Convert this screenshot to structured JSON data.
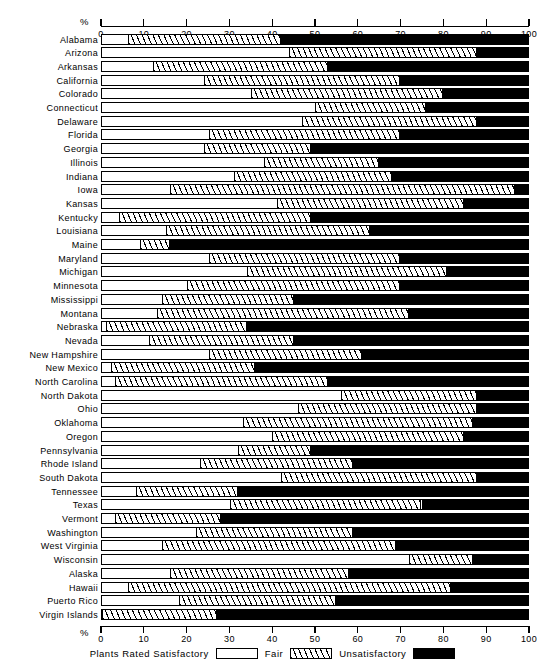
{
  "axis": {
    "unit_label": "%",
    "ticks": [
      0,
      10,
      20,
      30,
      40,
      50,
      60,
      70,
      80,
      90,
      100
    ]
  },
  "legend": {
    "prefix": "Plants  Rated  Satisfactory",
    "fair_label": "Fair",
    "unsat_label": "Unsatisfactory"
  },
  "chart_data": {
    "type": "bar",
    "orientation": "horizontal",
    "stacked": true,
    "title": "",
    "xlabel": "%",
    "ylabel": "",
    "xlim": [
      0,
      100
    ],
    "grid": false,
    "legend_position": "bottom",
    "series": [
      {
        "name": "Plants Rated Satisfactory",
        "fill": "white"
      },
      {
        "name": "Fair",
        "fill": "hatched"
      },
      {
        "name": "Unsatisfactory",
        "fill": "black"
      }
    ],
    "categories": [
      "Alabama",
      "Arizona",
      "Arkansas",
      "California",
      "Colorado",
      "Connecticut",
      "Delaware",
      "Florida",
      "Georgia",
      "Illinois",
      "Indiana",
      "Iowa",
      "Kansas",
      "Kentucky",
      "Louisiana",
      "Maine",
      "Maryland",
      "Michigan",
      "Minnesota",
      "Mississippi",
      "Montana",
      "Nebraska",
      "Nevada",
      "New Hampshire",
      "New Mexico",
      "North Carolina",
      "North Dakota",
      "Ohio",
      "Oklahoma",
      "Oregon",
      "Pennsylvania",
      "Rhode Island",
      "South Dakota",
      "Tennessee",
      "Texas",
      "Vermont",
      "Washington",
      "West Virginia",
      "Wisconsin",
      "Alaska",
      "Hawaii",
      "Puerto Rico",
      "Virgin Islands"
    ],
    "rows": [
      {
        "label": "Alabama",
        "satisfactory": 6,
        "fair": 36,
        "unsatisfactory": 58
      },
      {
        "label": "Arizona",
        "satisfactory": 44,
        "fair": 44,
        "unsatisfactory": 12
      },
      {
        "label": "Arkansas",
        "satisfactory": 12,
        "fair": 41,
        "unsatisfactory": 47
      },
      {
        "label": "California",
        "satisfactory": 24,
        "fair": 46,
        "unsatisfactory": 30
      },
      {
        "label": "Colorado",
        "satisfactory": 35,
        "fair": 45,
        "unsatisfactory": 20
      },
      {
        "label": "Connecticut",
        "satisfactory": 50,
        "fair": 26,
        "unsatisfactory": 24
      },
      {
        "label": "Delaware",
        "satisfactory": 47,
        "fair": 41,
        "unsatisfactory": 12
      },
      {
        "label": "Florida",
        "satisfactory": 25,
        "fair": 45,
        "unsatisfactory": 30
      },
      {
        "label": "Georgia",
        "satisfactory": 24,
        "fair": 25,
        "unsatisfactory": 51
      },
      {
        "label": "Illinois",
        "satisfactory": 38,
        "fair": 27,
        "unsatisfactory": 35
      },
      {
        "label": "Indiana",
        "satisfactory": 31,
        "fair": 37,
        "unsatisfactory": 32
      },
      {
        "label": "Iowa",
        "satisfactory": 16,
        "fair": 81,
        "unsatisfactory": 3
      },
      {
        "label": "Kansas",
        "satisfactory": 41,
        "fair": 44,
        "unsatisfactory": 15
      },
      {
        "label": "Kentucky",
        "satisfactory": 4,
        "fair": 45,
        "unsatisfactory": 51
      },
      {
        "label": "Louisiana",
        "satisfactory": 15,
        "fair": 48,
        "unsatisfactory": 37
      },
      {
        "label": "Maine",
        "satisfactory": 9,
        "fair": 7,
        "unsatisfactory": 84
      },
      {
        "label": "Maryland",
        "satisfactory": 25,
        "fair": 45,
        "unsatisfactory": 30
      },
      {
        "label": "Michigan",
        "satisfactory": 34,
        "fair": 47,
        "unsatisfactory": 19
      },
      {
        "label": "Minnesota",
        "satisfactory": 20,
        "fair": 50,
        "unsatisfactory": 30
      },
      {
        "label": "Mississippi",
        "satisfactory": 14,
        "fair": 31,
        "unsatisfactory": 55
      },
      {
        "label": "Montana",
        "satisfactory": 13,
        "fair": 59,
        "unsatisfactory": 28
      },
      {
        "label": "Nebraska",
        "satisfactory": 1,
        "fair": 33,
        "unsatisfactory": 66
      },
      {
        "label": "Nevada",
        "satisfactory": 11,
        "fair": 34,
        "unsatisfactory": 55
      },
      {
        "label": "New Hampshire",
        "satisfactory": 25,
        "fair": 36,
        "unsatisfactory": 39
      },
      {
        "label": "New Mexico",
        "satisfactory": 2,
        "fair": 34,
        "unsatisfactory": 64
      },
      {
        "label": "North Carolina",
        "satisfactory": 3,
        "fair": 50,
        "unsatisfactory": 47
      },
      {
        "label": "North Dakota",
        "satisfactory": 56,
        "fair": 32,
        "unsatisfactory": 12
      },
      {
        "label": "Ohio",
        "satisfactory": 46,
        "fair": 42,
        "unsatisfactory": 12
      },
      {
        "label": "Oklahoma",
        "satisfactory": 33,
        "fair": 54,
        "unsatisfactory": 13
      },
      {
        "label": "Oregon",
        "satisfactory": 40,
        "fair": 45,
        "unsatisfactory": 15
      },
      {
        "label": "Pennsylvania",
        "satisfactory": 32,
        "fair": 17,
        "unsatisfactory": 51
      },
      {
        "label": "Rhode Island",
        "satisfactory": 23,
        "fair": 36,
        "unsatisfactory": 41
      },
      {
        "label": "South Dakota",
        "satisfactory": 42,
        "fair": 46,
        "unsatisfactory": 12
      },
      {
        "label": "Tennessee",
        "satisfactory": 8,
        "fair": 24,
        "unsatisfactory": 68
      },
      {
        "label": "Texas",
        "satisfactory": 30,
        "fair": 45,
        "unsatisfactory": 25
      },
      {
        "label": "Vermont",
        "satisfactory": 3,
        "fair": 25,
        "unsatisfactory": 72
      },
      {
        "label": "Washington",
        "satisfactory": 22,
        "fair": 37,
        "unsatisfactory": 41
      },
      {
        "label": "West Virginia",
        "satisfactory": 14,
        "fair": 55,
        "unsatisfactory": 31
      },
      {
        "label": "Wisconsin",
        "satisfactory": 72,
        "fair": 15,
        "unsatisfactory": 13
      },
      {
        "label": "Alaska",
        "satisfactory": 16,
        "fair": 42,
        "unsatisfactory": 42
      },
      {
        "label": "Hawaii",
        "satisfactory": 6,
        "fair": 76,
        "unsatisfactory": 18
      },
      {
        "label": "Puerto Rico",
        "satisfactory": 18,
        "fair": 37,
        "unsatisfactory": 45
      },
      {
        "label": "Virgin Islands",
        "satisfactory": 0,
        "fair": 27,
        "unsatisfactory": 73
      }
    ]
  }
}
